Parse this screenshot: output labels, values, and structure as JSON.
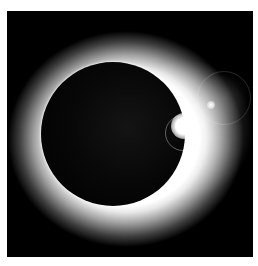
{
  "image": {
    "subject": "Total solar eclipse with diamond ring effect",
    "alt": "Black moon disc surrounded by a glowing white corona with a bright lens flare on the right edge",
    "colors": {
      "background": "#000000",
      "corona": "#ffffff",
      "border": "#ffffff"
    }
  }
}
